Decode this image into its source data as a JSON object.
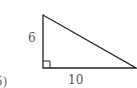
{
  "diagram": {
    "type": "right-triangle",
    "legs": {
      "vertical": {
        "label": "6"
      },
      "horizontal": {
        "label": "10"
      }
    },
    "right_angle_marker": true,
    "partial_option_label": "5)",
    "colors": {
      "stroke": "#222222",
      "label": "#555555",
      "background": "#ffffff"
    }
  }
}
